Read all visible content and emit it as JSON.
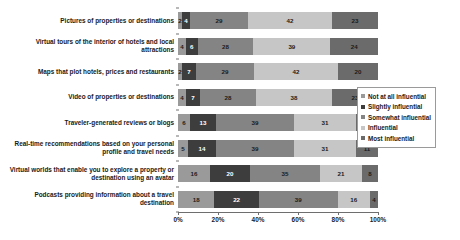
{
  "chart_data": {
    "type": "bar",
    "orientation": "horizontal",
    "stacked": true,
    "stack_mode": "percent",
    "title": "",
    "xlabel": "",
    "ylabel": "",
    "xlim": [
      0,
      100
    ],
    "grid": false,
    "legend_position": "right",
    "tick_labels": [
      "0%",
      "20%",
      "40%",
      "60%",
      "80%",
      "100%"
    ],
    "tick_values": [
      0,
      20,
      40,
      60,
      80,
      100
    ],
    "categories": [
      "Pictures of properties or destinations",
      "Virtual tours of the interior of hotels and local attractions",
      "Maps that plot hotels, prices and restaurants",
      "Video of properties or destinations",
      "Traveler-generated reviews or blogs",
      "Real-time recommendations based on your personal profile and travel needs",
      "Virtual worlds that enable you to explore a property or destination using an avatar",
      "Podcasts providing information about a travel destination"
    ],
    "series": [
      {
        "name": "Not at all influential",
        "color": "#9a9a9a",
        "text_color": "#1a1a1a",
        "values": [
          2,
          4,
          2,
          4,
          6,
          5,
          16,
          18
        ]
      },
      {
        "name": "Slightly influential",
        "color": "#3d3d3d",
        "text_color": "#ffffff",
        "values": [
          4,
          6,
          7,
          7,
          13,
          14,
          20,
          22
        ]
      },
      {
        "name": "Somewhat influential",
        "color": "#848484",
        "text_color": "#1a1a1a",
        "values": [
          29,
          28,
          29,
          28,
          39,
          39,
          35,
          39
        ]
      },
      {
        "name": "Influential",
        "color": "#c6c6c6",
        "text_color": "#1a1a1a",
        "values": [
          42,
          39,
          42,
          38,
          31,
          31,
          21,
          16
        ]
      },
      {
        "name": "Most influential",
        "color": "#6b6b6b",
        "text_color": "#1a1a1a",
        "values": [
          23,
          24,
          20,
          23,
          11,
          11,
          8,
          4
        ]
      }
    ]
  }
}
